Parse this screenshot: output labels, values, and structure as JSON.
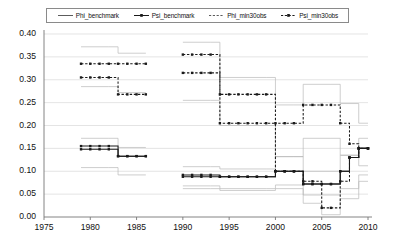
{
  "chart_data": {
    "type": "line",
    "title": "",
    "xlabel": "",
    "ylabel": "",
    "xlim": [
      1975,
      2010
    ],
    "ylim": [
      0.0,
      0.4
    ],
    "grid": true,
    "grid_axis": "y",
    "legend_position": "top",
    "xticks": [
      "1975",
      "1980",
      "1985",
      "1990",
      "1995",
      "2000",
      "2005",
      "2010"
    ],
    "yticks": [
      "0.00",
      "0.05",
      "0.10",
      "0.15",
      "0.20",
      "0.25",
      "0.30",
      "0.35",
      "0.40"
    ],
    "series": [
      {
        "name": "Phi_benchmark",
        "style": "solid-marker",
        "color": "#1a1a1a",
        "segments": [
          {
            "x": [
              1979,
              1980,
              1981,
              1982,
              1983,
              1984,
              1985,
              1986
            ],
            "y": [
              0.155,
              0.155,
              0.155,
              0.155,
              0.133,
              0.133,
              0.133,
              0.133
            ]
          },
          {
            "x": [
              1990,
              1991,
              1992,
              1993,
              1994,
              1995,
              1996,
              1997,
              1998,
              1999,
              2000,
              2001,
              2002,
              2003,
              2004,
              2005,
              2006,
              2007,
              2008,
              2009,
              2010
            ],
            "y": [
              0.092,
              0.092,
              0.092,
              0.092,
              0.088,
              0.088,
              0.088,
              0.088,
              0.088,
              0.088,
              0.1,
              0.1,
              0.1,
              0.072,
              0.072,
              0.072,
              0.072,
              0.1,
              0.13,
              0.15,
              0.15
            ]
          }
        ]
      },
      {
        "name": "Psi_benchmark",
        "style": "solid-marker",
        "color": "#1a1a1a",
        "segments": [
          {
            "x": [
              1979,
              1980,
              1981,
              1982,
              1983,
              1984,
              1985,
              1986
            ],
            "y": [
              0.148,
              0.148,
              0.148,
              0.148,
              0.133,
              0.133,
              0.133,
              0.133
            ]
          },
          {
            "x": [
              1990,
              1991,
              1992,
              1993,
              1994,
              1995,
              1996,
              1997,
              1998,
              1999,
              2000,
              2001,
              2002,
              2003,
              2004,
              2005,
              2006,
              2007,
              2008,
              2009,
              2010
            ],
            "y": [
              0.088,
              0.088,
              0.088,
              0.088,
              0.088,
              0.088,
              0.088,
              0.088,
              0.088,
              0.088,
              0.1,
              0.1,
              0.1,
              0.072,
              0.072,
              0.072,
              0.072,
              0.1,
              0.13,
              0.15,
              0.15
            ]
          }
        ]
      },
      {
        "name": "Phi_min30obs",
        "style": "dashed-marker",
        "color": "#1a1a1a",
        "segments": [
          {
            "x": [
              1979,
              1980,
              1981,
              1982,
              1983,
              1984,
              1985,
              1986
            ],
            "y": [
              0.335,
              0.335,
              0.335,
              0.335,
              0.335,
              0.335,
              0.335,
              0.335
            ]
          },
          {
            "x": [
              1990,
              1991,
              1992,
              1993,
              1994,
              1995,
              1996,
              1997,
              1998,
              1999,
              2000,
              2001,
              2002,
              2003,
              2004,
              2005,
              2006,
              2007,
              2008,
              2009,
              2010
            ],
            "y": [
              0.355,
              0.355,
              0.355,
              0.355,
              0.268,
              0.268,
              0.268,
              0.268,
              0.268,
              0.268,
              0.205,
              0.205,
              0.205,
              0.245,
              0.245,
              0.245,
              0.245,
              0.205,
              0.16,
              0.15,
              0.15
            ]
          }
        ]
      },
      {
        "name": "Psi_min30obs",
        "style": "dashed-marker",
        "color": "#1a1a1a",
        "segments": [
          {
            "x": [
              1979,
              1980,
              1981,
              1982,
              1983,
              1984,
              1985,
              1986
            ],
            "y": [
              0.305,
              0.305,
              0.305,
              0.305,
              0.268,
              0.268,
              0.268,
              0.268
            ]
          },
          {
            "x": [
              1990,
              1991,
              1992,
              1993,
              1994,
              1995,
              1996,
              1997,
              1998,
              1999,
              2000,
              2001,
              2002,
              2003,
              2004,
              2005,
              2006,
              2007,
              2008,
              2009,
              2010
            ],
            "y": [
              0.315,
              0.315,
              0.315,
              0.315,
              0.205,
              0.205,
              0.205,
              0.205,
              0.205,
              0.205,
              0.1,
              0.1,
              0.1,
              0.078,
              0.078,
              0.02,
              0.02,
              0.078,
              0.13,
              0.15,
              0.15
            ]
          }
        ]
      },
      {
        "name": "Phi_benchmark_upper_band",
        "style": "thin-gray",
        "color": "#b9b9b9",
        "segments": [
          {
            "x": [
              1979,
              1982,
              1983,
              1986
            ],
            "y": [
              0.172,
              0.172,
              0.152,
              0.152
            ]
          },
          {
            "x": [
              1990,
              1993,
              1994,
              1999,
              2000,
              2002,
              2003,
              2006,
              2007,
              2009,
              2010
            ],
            "y": [
              0.11,
              0.11,
              0.105,
              0.105,
              0.132,
              0.132,
              0.1,
              0.1,
              0.135,
              0.172,
              0.172
            ]
          }
        ]
      },
      {
        "name": "Phi_benchmark_lower_band",
        "style": "thin-gray",
        "color": "#b9b9b9",
        "segments": [
          {
            "x": [
              1979,
              1982,
              1983,
              1986
            ],
            "y": [
              0.108,
              0.108,
              0.092,
              0.092
            ]
          },
          {
            "x": [
              1990,
              1993,
              1994,
              1999,
              2000,
              2002,
              2003,
              2006,
              2007,
              2009,
              2010
            ],
            "y": [
              0.068,
              0.068,
              0.062,
              0.062,
              0.07,
              0.07,
              0.048,
              0.048,
              0.062,
              0.092,
              0.092
            ]
          }
        ]
      },
      {
        "name": "Phi_min30obs_upper_band",
        "style": "thin-gray",
        "color": "#b9b9b9",
        "segments": [
          {
            "x": [
              1979,
              1982,
              1983,
              1986
            ],
            "y": [
              0.372,
              0.372,
              0.358,
              0.358
            ]
          },
          {
            "x": [
              1990,
              1993,
              1994,
              1999,
              2000,
              2002,
              2003,
              2006,
              2007,
              2009,
              2010
            ],
            "y": [
              0.382,
              0.382,
              0.305,
              0.305,
              0.245,
              0.245,
              0.29,
              0.29,
              0.248,
              0.205,
              0.205
            ]
          }
        ]
      },
      {
        "name": "Phi_min30obs_lower_band",
        "style": "thin-gray",
        "color": "#b9b9b9",
        "segments": [
          {
            "x": [
              1979,
              1982,
              1983,
              1986
            ],
            "y": [
              0.285,
              0.285,
              0.272,
              0.272
            ]
          },
          {
            "x": [
              1990,
              1993,
              1994,
              1999,
              2000,
              2002,
              2003,
              2006,
              2007,
              2009,
              2010
            ],
            "y": [
              0.255,
              0.255,
              0.2,
              0.2,
              0.132,
              0.132,
              0.172,
              0.172,
              0.135,
              0.112,
              0.112
            ]
          }
        ]
      },
      {
        "name": "Psi_min30obs_band_low",
        "style": "thin-gray",
        "color": "#b9b9b9",
        "segments": [
          {
            "x": [
              1990,
              1993,
              1994,
              1999,
              2000,
              2002,
              2003,
              2005,
              2006,
              2007,
              2009,
              2010
            ],
            "y": [
              0.062,
              0.062,
              0.058,
              0.058,
              0.062,
              0.062,
              0.03,
              0.005,
              0.005,
              0.04,
              0.078,
              0.078
            ]
          }
        ]
      }
    ]
  },
  "legend": {
    "items": [
      {
        "label": "Phi_benchmark",
        "swatch": "solid-plain"
      },
      {
        "label": "Psi_benchmark",
        "swatch": "solid-marker"
      },
      {
        "label": "Phi_min30obs",
        "swatch": "dashed-plain"
      },
      {
        "label": "Psi_min30obs",
        "swatch": "dashed-marker"
      }
    ]
  },
  "axis": {
    "y_labels": [
      "0.40",
      "0.35",
      "0.30",
      "0.25",
      "0.20",
      "0.15",
      "0.10",
      "0.05",
      "0.00"
    ],
    "x_labels": [
      "1975",
      "1980",
      "1985",
      "1990",
      "1995",
      "2000",
      "2005",
      "2010"
    ]
  }
}
